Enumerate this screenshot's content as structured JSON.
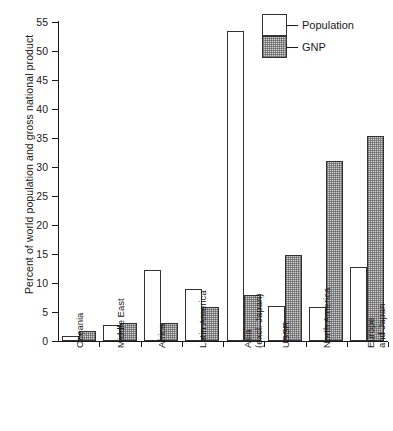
{
  "chart_data": {
    "type": "bar",
    "title": "",
    "xlabel": "",
    "ylabel": "Percent of world population and gross national product",
    "ylim": [
      0,
      55
    ],
    "yticks": [
      0,
      5,
      10,
      15,
      20,
      25,
      30,
      35,
      40,
      45,
      50,
      55
    ],
    "grid": false,
    "legend_position": "top-right",
    "categories": [
      "Oceania",
      "Middle East",
      "Africa",
      "Latin America",
      "Asia\n(excl. Japan)",
      "USSR",
      "North America",
      "Europe\nand Japan"
    ],
    "category_lines": [
      [
        "Oceania"
      ],
      [
        "Middle East"
      ],
      [
        "Africa"
      ],
      [
        "Latin America"
      ],
      [
        "Asia",
        "(excl. Japan)"
      ],
      [
        "USSR"
      ],
      [
        "North America"
      ],
      [
        "Europe",
        "and Japan"
      ]
    ],
    "series": [
      {
        "name": "Population",
        "fill": "white",
        "values": [
          0.8,
          2.8,
          12.3,
          9.0,
          53.5,
          6.0,
          5.8,
          12.7
        ]
      },
      {
        "name": "GNP",
        "fill": "stippled-gray",
        "values": [
          1.7,
          3.1,
          3.1,
          5.8,
          8.0,
          14.8,
          31.0,
          35.3
        ]
      }
    ]
  },
  "legend": {
    "items": [
      {
        "label": "Population"
      },
      {
        "label": "GNP"
      }
    ]
  },
  "colors": {
    "axis": "#1a1a1a",
    "population_fill": "#ffffff",
    "gnp_fill": "#d0d0d0",
    "bar_stroke": "#333333",
    "background": "#ffffff"
  }
}
